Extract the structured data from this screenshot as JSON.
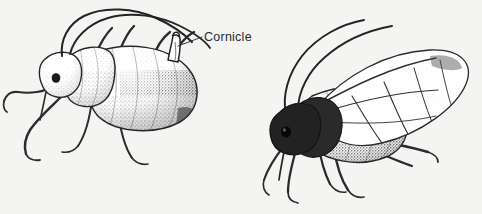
{
  "figure": {
    "kind": "scientific-illustration",
    "medium": "pen-and-ink stipple drawing",
    "background_color": "#f4f4f3",
    "ink_color": "#262626",
    "width_px": 482,
    "height_px": 214
  },
  "annotations": {
    "cornicle": {
      "label": "Cornicle",
      "text_color": "#2b2b2b",
      "leader_line_color": "#3a3a3a",
      "points_to": "cornicle tube on abdomen of wingless aphid"
    }
  },
  "specimens": [
    {
      "id": "apterous-aphid",
      "name": "Wingless aphid",
      "position": "left",
      "has_wings": false,
      "parts": [
        "head",
        "compound eye",
        "antenna-left",
        "antenna-right",
        "thorax",
        "abdomen",
        "cornicle",
        "foreleg",
        "midleg",
        "hindleg"
      ]
    },
    {
      "id": "alate-aphid",
      "name": "Winged aphid",
      "position": "right",
      "has_wings": true,
      "parts": [
        "head",
        "compound eye",
        "antenna-left",
        "antenna-right",
        "thorax",
        "abdomen",
        "forewing",
        "hindwing",
        "wing-venation",
        "foreleg",
        "midleg",
        "hindleg"
      ]
    }
  ]
}
